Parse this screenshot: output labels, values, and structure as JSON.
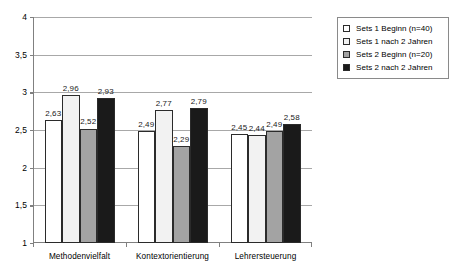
{
  "chart_data": {
    "type": "bar",
    "title": "",
    "subtitle": "",
    "xlabel": "",
    "ylabel": "",
    "ylim": [
      1,
      4
    ],
    "ytick_labels": [
      "1",
      "1,5",
      "2",
      "2,5",
      "3",
      "3,5",
      "4"
    ],
    "ytick_values": [
      1,
      1.5,
      2,
      2.5,
      3,
      3.5,
      4
    ],
    "grid": true,
    "legend_position": "right",
    "categories": [
      "Methodenvielfalt",
      "Kontextorientierung",
      "Lehrersteuerung"
    ],
    "series": [
      {
        "name": "Sets 1 Beginn (n=40)",
        "color": "#ffffff",
        "values": [
          2.63,
          2.49,
          2.45
        ],
        "labels": [
          "2,63",
          "2,49",
          "2,45"
        ]
      },
      {
        "name": "Sets 1 nach 2 Jahren",
        "color": "#f2f2f2",
        "values": [
          2.96,
          2.77,
          2.44
        ],
        "labels": [
          "2,96",
          "2,77",
          "2,44"
        ]
      },
      {
        "name": "Sets 2 Beginn (n=20)",
        "color": "#a3a3a3",
        "values": [
          2.52,
          2.29,
          2.49
        ],
        "labels": [
          "2,52",
          "2,29",
          "2,49"
        ]
      },
      {
        "name": "Sets 2 nach 2 Jahren",
        "color": "#1a1a1a",
        "values": [
          2.93,
          2.79,
          2.58
        ],
        "labels": [
          "2,93",
          "2,79",
          "2,58"
        ]
      }
    ]
  },
  "legend": {
    "items": [
      {
        "label": "Sets 1 Beginn (n=40)",
        "color": "#ffffff"
      },
      {
        "label": "Sets 1 nach 2 Jahren",
        "color": "#f2f2f2"
      },
      {
        "label": "Sets 2 Beginn (n=20)",
        "color": "#a3a3a3"
      },
      {
        "label": "Sets 2 nach 2 Jahren",
        "color": "#1a1a1a"
      }
    ]
  }
}
